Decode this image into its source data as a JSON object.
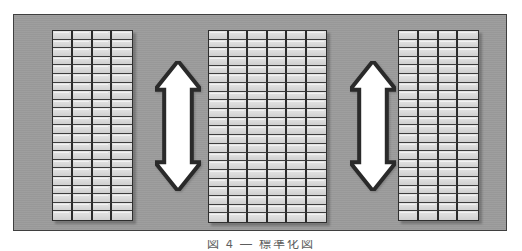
{
  "figure": {
    "background_color": "#9b9b9b",
    "frame_border_color": "#3f3f3f",
    "cell_color": "#d9d9d9",
    "grid_line_color": "#3c3c3c",
    "arrow_fill_color": "#ffffff",
    "arrow_outline_color": "#2a2a2a"
  },
  "panels": [
    {
      "name": "left-panel",
      "label": "Left grid panel",
      "columns": 4,
      "rows": 22,
      "x": 38,
      "y": 15,
      "width": 81,
      "height": 191
    },
    {
      "name": "middle-panel",
      "label": "Middle grid panel",
      "columns": 6,
      "rows": 22,
      "x": 194,
      "y": 15,
      "width": 119,
      "height": 193
    },
    {
      "name": "right-panel",
      "label": "Right grid panel",
      "columns": 4,
      "rows": 22,
      "x": 384,
      "y": 15,
      "width": 81,
      "height": 191
    }
  ],
  "arrows": [
    {
      "name": "left-arrow",
      "label": "Double-headed vertical arrow between left and middle panel",
      "direction": "up-down",
      "x": 141,
      "y": 46,
      "width": 46,
      "height": 130
    },
    {
      "name": "right-arrow",
      "label": "Double-headed vertical arrow between middle and right panel",
      "direction": "up-down",
      "x": 336,
      "y": 46,
      "width": 46,
      "height": 130
    }
  ],
  "caption": {
    "text": "図 4 — 標準化図"
  }
}
